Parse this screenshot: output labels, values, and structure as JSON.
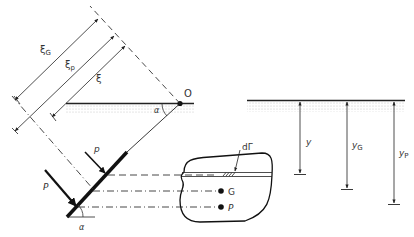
{
  "figure": {
    "left_panel": {
      "origin_label": "O",
      "angle_label_top": "α",
      "angle_label_bottom": "α",
      "dim_labels": {
        "xi_G": "ξ",
        "xi_G_sub": "G",
        "xi_p": "ξ",
        "xi_p_sub": "p",
        "xi": "ξ"
      },
      "force_labels": {
        "p": "p",
        "P": "P"
      }
    },
    "plate_panel": {
      "element_label": "dΓ",
      "centroid_label": "G",
      "pressure_center_label": "P"
    },
    "right_panel": {
      "depth_labels": [
        {
          "main": "y",
          "sub": ""
        },
        {
          "main": "y",
          "sub": "G"
        },
        {
          "main": "y",
          "sub": "P"
        }
      ]
    }
  }
}
